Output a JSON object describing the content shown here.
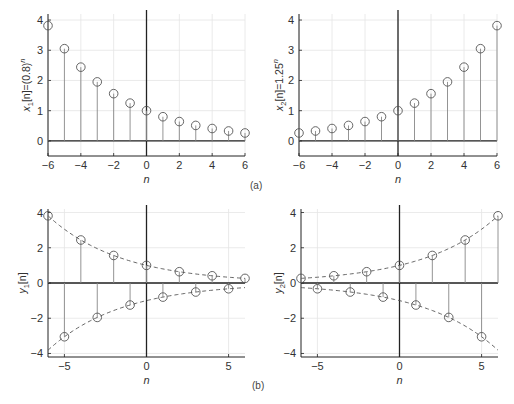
{
  "figure": {
    "panel_labels": [
      "(a)",
      "(b)"
    ],
    "colors": {
      "axis": "#222222",
      "stem": "#888888",
      "marker": "#555555",
      "grid": "#e4e4e4",
      "envelope": "#555555"
    }
  },
  "chart_data": [
    {
      "id": "x1",
      "type": "stem",
      "ylabel": "x1[n]=(0.8)^n",
      "ylabel_parts": {
        "base": "x",
        "sub": "1",
        "mid": "[n]=(0.8)",
        "sup": "n"
      },
      "xlabel": "n",
      "xlim": [
        -6,
        6
      ],
      "ylim": [
        -0.5,
        4.2
      ],
      "xticks": [
        -6,
        -4,
        -2,
        0,
        2,
        4,
        6
      ],
      "xtick_labels": [
        "−6",
        "−4",
        "−2",
        "0",
        "2",
        "4",
        "6"
      ],
      "yticks": [
        0,
        1,
        2,
        3,
        4
      ],
      "ytick_labels": [
        "0",
        "1",
        "2",
        "3",
        "4"
      ],
      "grid": true,
      "x": [
        -6,
        -5,
        -4,
        -3,
        -2,
        -1,
        0,
        1,
        2,
        3,
        4,
        5,
        6
      ],
      "values": [
        3.815,
        3.052,
        2.441,
        1.953,
        1.563,
        1.25,
        1.0,
        0.8,
        0.64,
        0.512,
        0.41,
        0.328,
        0.262
      ],
      "envelope": false,
      "panel": "a"
    },
    {
      "id": "x2",
      "type": "stem",
      "ylabel": "x2[n]=1.25^n",
      "ylabel_parts": {
        "base": "x",
        "sub": "2",
        "mid": "[n]=1.25",
        "sup": "n"
      },
      "xlabel": "n",
      "xlim": [
        -6,
        6
      ],
      "ylim": [
        -0.5,
        4.2
      ],
      "xticks": [
        -6,
        -4,
        -2,
        0,
        2,
        4,
        6
      ],
      "xtick_labels": [
        "−6",
        "−4",
        "−2",
        "0",
        "2",
        "4",
        "6"
      ],
      "yticks": [
        0,
        1,
        2,
        3,
        4
      ],
      "ytick_labels": [
        "0",
        "1",
        "2",
        "3",
        "4"
      ],
      "grid": true,
      "x": [
        -6,
        -5,
        -4,
        -3,
        -2,
        -1,
        0,
        1,
        2,
        3,
        4,
        5,
        6
      ],
      "values": [
        0.262,
        0.328,
        0.41,
        0.512,
        0.64,
        0.8,
        1.0,
        1.25,
        1.563,
        1.953,
        2.441,
        3.052,
        3.815
      ],
      "envelope": false,
      "panel": "a"
    },
    {
      "id": "y1",
      "type": "stem",
      "ylabel": "y1[n]",
      "ylabel_parts": {
        "base": "y",
        "sub": "1",
        "mid": "[n]",
        "sup": ""
      },
      "xlabel": "n",
      "xlim": [
        -6,
        6
      ],
      "ylim": [
        -4.2,
        4.2
      ],
      "xticks": [
        -5,
        0,
        5
      ],
      "xtick_labels": [
        "−5",
        "0",
        "5"
      ],
      "yticks": [
        -4,
        -2,
        0,
        2,
        4
      ],
      "ytick_labels": [
        "−4",
        "−2",
        "0",
        "2",
        "4"
      ],
      "grid": true,
      "x": [
        -6,
        -5,
        -4,
        -3,
        -2,
        -1,
        0,
        1,
        2,
        3,
        4,
        5,
        6
      ],
      "values": [
        3.815,
        -3.052,
        2.441,
        -1.953,
        1.563,
        -1.25,
        1.0,
        -0.8,
        0.64,
        -0.512,
        0.41,
        -0.328,
        0.262
      ],
      "envelope": true,
      "envelope_base": 0.8,
      "panel": "b"
    },
    {
      "id": "y2",
      "type": "stem",
      "ylabel": "y2[n]",
      "ylabel_parts": {
        "base": "y",
        "sub": "2",
        "mid": "[n]",
        "sup": ""
      },
      "xlabel": "n",
      "xlim": [
        -6,
        6
      ],
      "ylim": [
        -4.2,
        4.2
      ],
      "xticks": [
        -5,
        0,
        5
      ],
      "xtick_labels": [
        "−5",
        "0",
        "5"
      ],
      "yticks": [
        -4,
        -2,
        0,
        2,
        4
      ],
      "ytick_labels": [
        "−4",
        "−2",
        "0",
        "2",
        "4"
      ],
      "grid": true,
      "x": [
        -6,
        -5,
        -4,
        -3,
        -2,
        -1,
        0,
        1,
        2,
        3,
        4,
        5,
        6
      ],
      "values": [
        0.262,
        -0.328,
        0.41,
        -0.512,
        0.64,
        -0.8,
        1.0,
        -1.25,
        1.563,
        -1.953,
        2.441,
        -3.052,
        3.815
      ],
      "envelope": true,
      "envelope_base": 1.25,
      "panel": "b"
    }
  ]
}
